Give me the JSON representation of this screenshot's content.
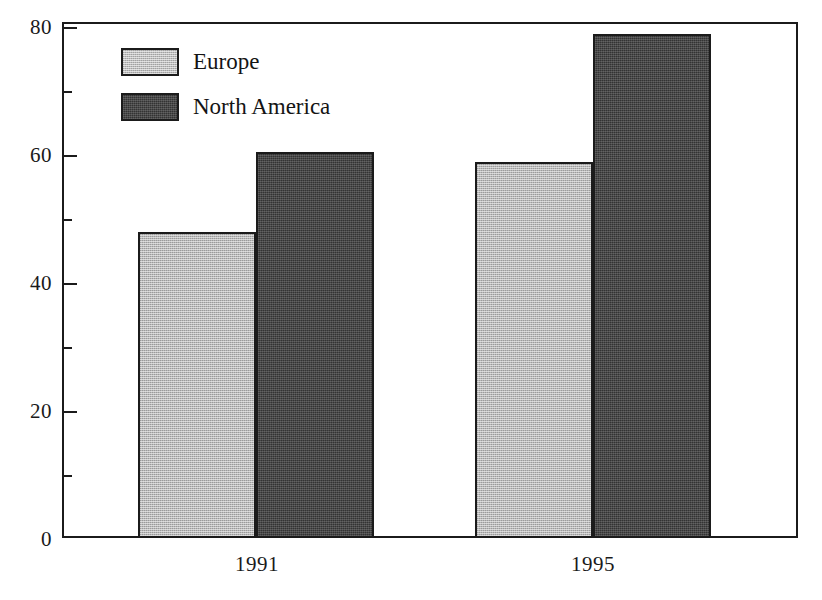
{
  "chart_data": {
    "type": "bar",
    "title": "",
    "subtitle": "",
    "xlabel": "",
    "ylabel": "",
    "categories": [
      "1991",
      "1995"
    ],
    "series": [
      {
        "name": "Europe",
        "values": [
          48,
          59
        ],
        "color": "#b9b9b9"
      },
      {
        "name": "North America",
        "values": [
          60.5,
          79
        ],
        "color": "#333333"
      }
    ],
    "ylim": [
      0,
      80
    ],
    "yticks": [
      0,
      20,
      40,
      60,
      80
    ],
    "ytick_labels": [
      "0",
      "20",
      "40",
      "60",
      "80"
    ],
    "yminor_ticks": [
      10,
      30,
      50,
      70
    ],
    "grid": false,
    "legend_position": "upper-left",
    "frame": true,
    "orientation": "vertical",
    "grouped": true
  },
  "legend": {
    "entries": [
      {
        "label": "Europe",
        "swatch": "light-gray-dither"
      },
      {
        "label": "North America",
        "swatch": "dark-gray-dither"
      }
    ]
  },
  "axis": {
    "y_labels": [
      "80",
      "60",
      "40",
      "20",
      "0"
    ],
    "x_labels": [
      "1991",
      "1995"
    ]
  },
  "colors": {
    "europe": "#b9b9b9",
    "north_america": "#333333",
    "axis": "#1b1b1b",
    "background": "#ffffff",
    "text": "#1a1a1a"
  }
}
